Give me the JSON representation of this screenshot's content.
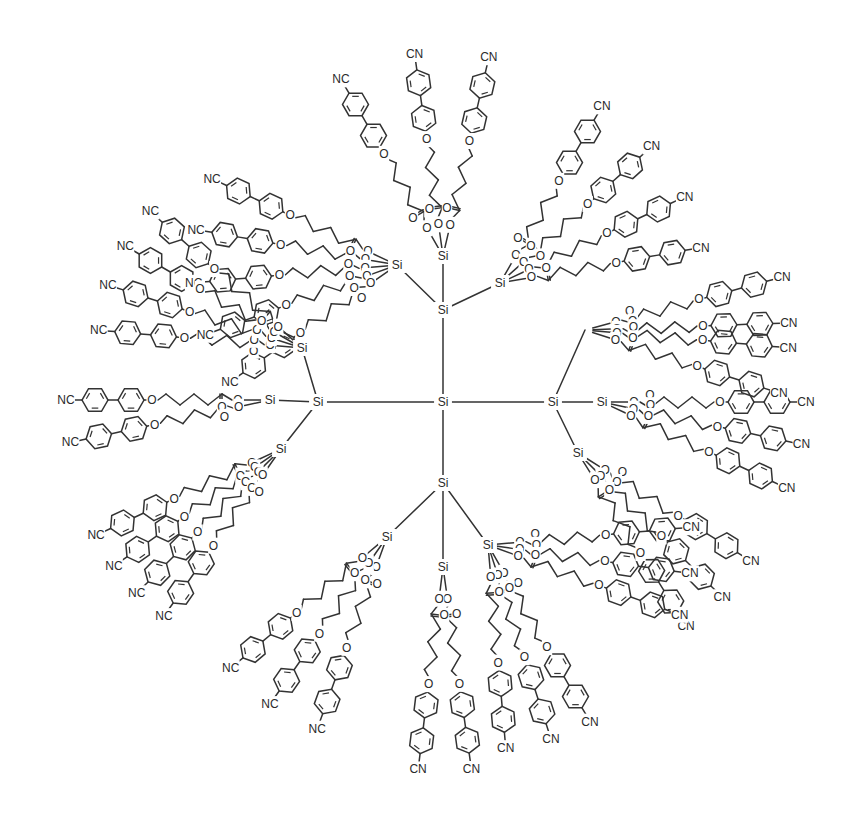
{
  "diagram": {
    "type": "chemical-structure",
    "colors": {
      "ink": "#333333",
      "background": "#ffffff"
    },
    "labels": {
      "silicon": "Si",
      "oxygen": "O",
      "cyano_right": "CN",
      "cyano_left": "NC"
    },
    "core": {
      "id": "core",
      "label": "Si",
      "x": 443,
      "y": 402
    },
    "branches": [
      {
        "id": "top",
        "label": "Si",
        "x": 443,
        "y": 310,
        "children": [
          {
            "label": "Si",
            "x": 397,
            "y": 265,
            "arms": [
              205,
              190,
              175,
              160,
              145
            ]
          },
          {
            "label": "Si",
            "x": 443,
            "y": 256,
            "arms": [
              240,
              262,
              283
            ]
          },
          {
            "label": "Si",
            "x": 500,
            "y": 283,
            "arms": [
              300,
              318,
              335,
              350
            ]
          }
        ]
      },
      {
        "id": "right",
        "label": "Si",
        "x": 553,
        "y": 402,
        "children": [
          {
            "label": "",
            "x": 585,
            "y": 330,
            "arms": [
              345,
              358,
              5,
              18
            ]
          },
          {
            "label": "Si",
            "x": 602,
            "y": 402,
            "arms": [
              0,
              12,
              25
            ]
          },
          {
            "label": "Si",
            "x": 578,
            "y": 453,
            "arms": [
              32,
              45,
              58
            ]
          }
        ]
      },
      {
        "id": "bottom",
        "label": "Si",
        "x": 443,
        "y": 483,
        "children": [
          {
            "label": "Si",
            "x": 387,
            "y": 537,
            "arms": [
              110,
              125,
              140
            ]
          },
          {
            "label": "Si",
            "x": 443,
            "y": 567,
            "arms": [
              82,
              97
            ]
          },
          {
            "label": "Si",
            "x": 488,
            "y": 545,
            "arms": [
              60,
              72,
              85,
              355,
              8,
              20
            ]
          }
        ]
      },
      {
        "id": "left",
        "label": "Si",
        "x": 318,
        "y": 402,
        "children": [
          {
            "label": "Si",
            "x": 302,
            "y": 348,
            "arms": [
              185,
              198,
              210,
              222
            ]
          },
          {
            "label": "Si",
            "x": 270,
            "y": 400,
            "arms": [
              180,
              168
            ]
          },
          {
            "label": "Si",
            "x": 281,
            "y": 449,
            "arms": [
              155,
              145,
              135,
              125
            ]
          }
        ]
      }
    ],
    "arm": {
      "sequence": [
        "O",
        "C(=O)",
        "(CH2)4",
        "O",
        "C6H4",
        "C6H4",
        "CN"
      ],
      "terminal_group": "cyanobiphenyl"
    }
  }
}
